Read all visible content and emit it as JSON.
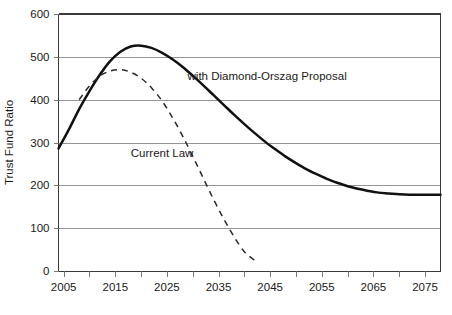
{
  "chart_data": {
    "type": "line",
    "title": "",
    "xlabel": "",
    "ylabel": "Trust Fund Ratio",
    "xlim": [
      2004,
      2078
    ],
    "ylim": [
      0,
      600
    ],
    "grid": true,
    "grid_axis": "y",
    "legend_position": "inline-annotations",
    "ytick_labels": [
      "0",
      "100",
      "200",
      "300",
      "400",
      "500",
      "600"
    ],
    "ytick_values": [
      0,
      100,
      200,
      300,
      400,
      500,
      600
    ],
    "xtick_labels": [
      "2005",
      "2015",
      "2025",
      "2035",
      "2045",
      "2055",
      "2065",
      "2075"
    ],
    "xtick_values": [
      2005,
      2015,
      2025,
      2035,
      2045,
      2055,
      2065,
      2075
    ],
    "xtick_minor_values": [
      2010,
      2020,
      2030,
      2040,
      2050,
      2060,
      2070
    ],
    "series": [
      {
        "name": "with Diamond-Orszag Proposal",
        "style": "solid",
        "color": "#111111",
        "annotation": "with Diamond-Orszag Proposal",
        "x": [
          2004,
          2006,
          2008,
          2010,
          2012,
          2014,
          2016,
          2018,
          2020,
          2022,
          2024,
          2026,
          2028,
          2030,
          2032,
          2034,
          2036,
          2038,
          2040,
          2042,
          2044,
          2046,
          2048,
          2050,
          2052,
          2054,
          2056,
          2058,
          2060,
          2062,
          2064,
          2066,
          2068,
          2070,
          2072,
          2074,
          2076,
          2078
        ],
        "values": [
          286,
          330,
          378,
          420,
          458,
          490,
          512,
          524,
          526,
          521,
          510,
          495,
          477,
          456,
          434,
          411,
          388,
          365,
          343,
          322,
          302,
          284,
          267,
          252,
          238,
          226,
          215,
          206,
          198,
          192,
          187,
          183,
          181,
          179,
          178,
          178,
          178,
          178
        ]
      },
      {
        "name": "Current Law",
        "style": "dashed",
        "color": "#2a2a2a",
        "annotation": "Current Law",
        "x": [
          2008,
          2010,
          2012,
          2014,
          2016,
          2018,
          2020,
          2022,
          2024,
          2026,
          2028,
          2030,
          2032,
          2034,
          2036,
          2038,
          2040,
          2042
        ],
        "values": [
          400,
          432,
          455,
          467,
          470,
          464,
          450,
          428,
          398,
          360,
          316,
          268,
          218,
          168,
          122,
          80,
          45,
          25
        ]
      }
    ],
    "annotations": [
      {
        "text": "with Diamond-Orszag Proposal",
        "x": 2029,
        "y": 445,
        "anchor": "start"
      },
      {
        "text": "Current Law",
        "x": 2018,
        "y": 267,
        "anchor": "start"
      }
    ]
  }
}
